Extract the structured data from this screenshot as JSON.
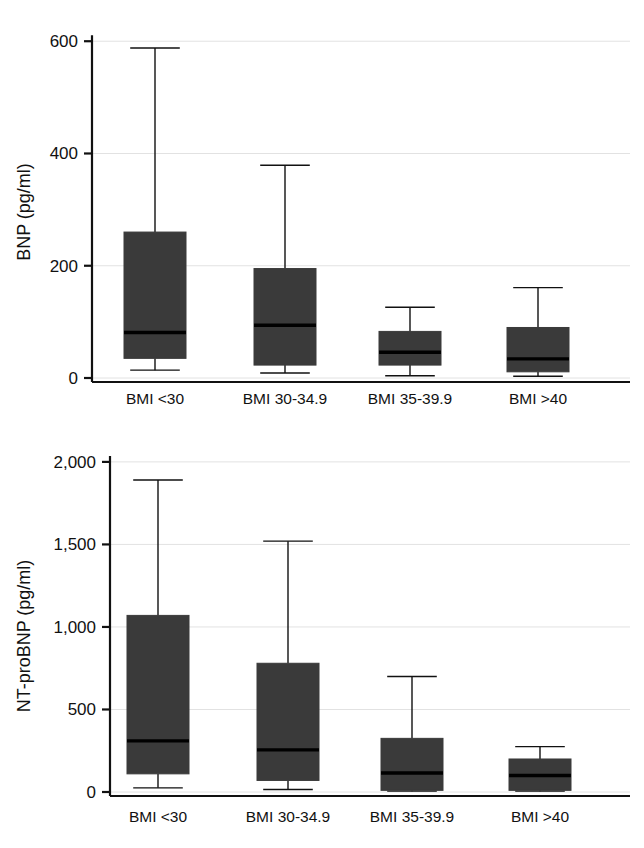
{
  "figure": {
    "background": "#ffffff",
    "box_fill": "#3a3a3a",
    "line_color": "#111111",
    "grid_color": "#e2e2e2"
  },
  "chart_data": [
    {
      "type": "box",
      "panel_name": "bnp-panel",
      "title": "",
      "xlabel": "",
      "ylabel": "BNP (pg/ml)",
      "ylim": [
        0,
        620
      ],
      "yticks": [
        0,
        200,
        400,
        600
      ],
      "ytick_labels": [
        "0",
        "200",
        "400",
        "600"
      ],
      "grid": true,
      "legend": "none",
      "categories": [
        "BMI <30",
        "BMI 30-34.9",
        "BMI 35-39.9",
        "BMI >40"
      ],
      "boxes": [
        {
          "category": "BMI <30",
          "whisker_low": 14,
          "q1": 35,
          "median": 81,
          "q3": 260,
          "whisker_high": 588
        },
        {
          "category": "BMI 30-34.9",
          "whisker_low": 9,
          "q1": 23,
          "median": 94,
          "q3": 195,
          "whisker_high": 379
        },
        {
          "category": "BMI 35-39.9",
          "whisker_low": 4,
          "q1": 23,
          "median": 46,
          "q3": 83,
          "whisker_high": 126
        },
        {
          "category": "BMI >40",
          "whisker_low": 3,
          "q1": 11,
          "median": 34,
          "q3": 90,
          "whisker_high": 161
        }
      ]
    },
    {
      "type": "box",
      "panel_name": "ntprobnp-panel",
      "title": "",
      "xlabel": "",
      "ylabel": "NT-proBNP (pg/ml)",
      "ylim": [
        0,
        2060
      ],
      "yticks": [
        0,
        500,
        1000,
        1500,
        2000
      ],
      "ytick_labels": [
        "0",
        "500",
        "1,000",
        "1,500",
        "2,000"
      ],
      "grid": true,
      "legend": "none",
      "categories": [
        "BMI <30",
        "BMI 30-34.9",
        "BMI 35-39.9",
        "BMI >40"
      ],
      "boxes": [
        {
          "category": "BMI <30",
          "whisker_low": 25,
          "q1": 110,
          "median": 310,
          "q3": 1070,
          "whisker_high": 1890
        },
        {
          "category": "BMI 30-34.9",
          "whisker_low": 15,
          "q1": 70,
          "median": 255,
          "q3": 780,
          "whisker_high": 1520
        },
        {
          "category": "BMI 35-39.9",
          "whisker_low": 5,
          "q1": 10,
          "median": 115,
          "q3": 325,
          "whisker_high": 700
        },
        {
          "category": "BMI >40",
          "whisker_low": 5,
          "q1": 10,
          "median": 100,
          "q3": 200,
          "whisker_high": 275
        }
      ]
    }
  ]
}
